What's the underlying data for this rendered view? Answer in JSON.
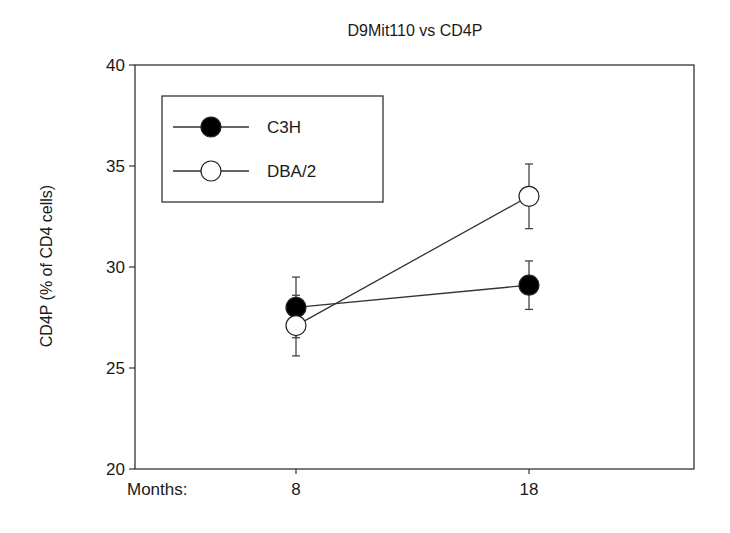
{
  "chart_data": {
    "type": "line",
    "title": "D9Mit110 vs CD4P",
    "xlabel": "Months:",
    "ylabel": "CD4P (% of CD4 cells)",
    "x": [
      8,
      18
    ],
    "x_tick_labels": [
      "8",
      "18"
    ],
    "ylim": [
      20,
      40
    ],
    "y_ticks": [
      20,
      25,
      30,
      35,
      40
    ],
    "grid": false,
    "legend_position": "upper-left",
    "series": [
      {
        "name": "C3H",
        "marker": "filled-circle",
        "color": "#000000",
        "values": [
          28.0,
          29.1
        ],
        "error_upper": [
          29.5,
          30.3
        ],
        "error_lower": [
          26.5,
          27.9
        ]
      },
      {
        "name": "DBA/2",
        "marker": "open-circle",
        "color": "#000000",
        "values": [
          27.1,
          33.5
        ],
        "error_upper": [
          28.6,
          35.1
        ],
        "error_lower": [
          25.6,
          31.9
        ]
      }
    ]
  }
}
